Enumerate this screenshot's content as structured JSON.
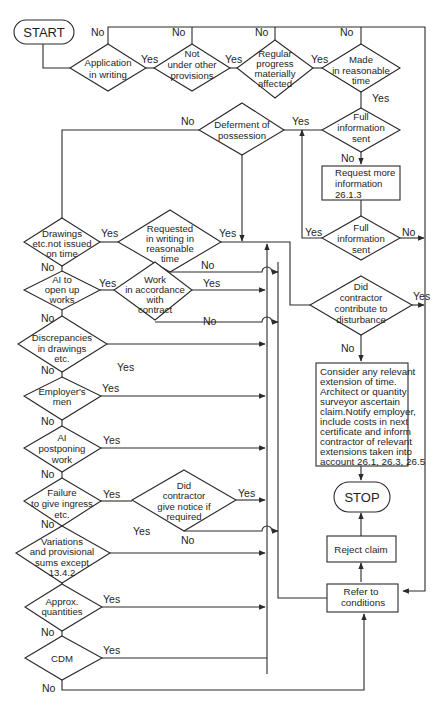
{
  "diagram": {
    "type": "flowchart",
    "nodes": {
      "start": "START",
      "stop": "STOP",
      "application": [
        "Application",
        "in writing"
      ],
      "not_other": [
        "Not",
        "under other",
        "provisions"
      ],
      "regular_progress": [
        "Regular",
        "progress",
        "materially",
        "affected"
      ],
      "reasonable_time": [
        "Made",
        "in reasonable",
        "time"
      ],
      "full_info_1": [
        "Full",
        "information",
        "sent"
      ],
      "request_more": [
        "Request more",
        "information",
        "26.1.3"
      ],
      "full_info_2": [
        "Full",
        "information",
        "sent"
      ],
      "deferment": [
        "Deferment of",
        "possession"
      ],
      "drawings": [
        "Drawings",
        "etc.not issued",
        "on time"
      ],
      "requested_writing": [
        "Requested",
        "in writing in",
        "reasonable",
        "time"
      ],
      "ai_open_up": [
        "AI to",
        "open up",
        "works"
      ],
      "work_accordance": [
        "Work",
        "in accordance",
        "with",
        "contract"
      ],
      "discrepancies": [
        "Discrepancies",
        "in drawings",
        "etc."
      ],
      "employers_men": [
        "Employer's",
        "men"
      ],
      "ai_postponing": [
        "AI",
        "postponing",
        "work"
      ],
      "failure_ingress": [
        "Failure",
        "to give ingress",
        "etc."
      ],
      "did_notice": [
        "Did",
        "contractor",
        "give notice if",
        "required"
      ],
      "variations": [
        "Variations",
        "and provisional",
        "sums except",
        "13.4.2"
      ],
      "approx_quantities": [
        "Approx.",
        "quantities"
      ],
      "cdm": [
        "CDM"
      ],
      "did_contribute": [
        "Did",
        "contractor",
        "contribute to",
        "disturbance"
      ],
      "consider": [
        "Consider any relevant",
        "extension of time.",
        "Architect or quantity",
        "surveyor ascertain",
        "claim.Notify employer,",
        "include costs in next",
        "certificate and inform",
        "contractor of relevant",
        "extensions taken into",
        "account 26.1, 26.3, 26.5"
      ],
      "reject": "Reject claim",
      "refer": [
        "Refer to",
        "conditions"
      ]
    },
    "labels": {
      "yes": "Yes",
      "no": "No"
    }
  }
}
